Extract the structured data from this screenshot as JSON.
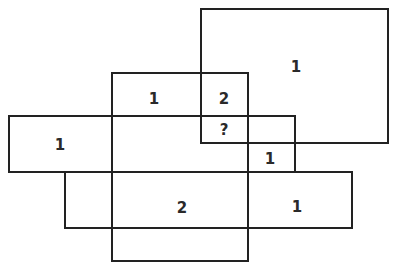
{
  "diagram": {
    "line_color": "#222222",
    "rectangles": [
      {
        "id": "big-square",
        "x": 200,
        "y": 8,
        "w": 189,
        "h": 136
      },
      {
        "id": "tall-center",
        "x": 111,
        "y": 72,
        "w": 138,
        "h": 190
      },
      {
        "id": "left-bar",
        "x": 8,
        "y": 115,
        "w": 288,
        "h": 58
      },
      {
        "id": "bottom-bar",
        "x": 64,
        "y": 171,
        "w": 289,
        "h": 58
      }
    ],
    "labels": [
      {
        "id": "big-square-only",
        "text": "1",
        "x": 296,
        "y": 67
      },
      {
        "id": "tall-top",
        "text": "1",
        "x": 154,
        "y": 99
      },
      {
        "id": "tall-big-overlap",
        "text": "2",
        "x": 224,
        "y": 99
      },
      {
        "id": "triple-overlap",
        "text": "?",
        "x": 224,
        "y": 130
      },
      {
        "id": "left-bar-only",
        "text": "1",
        "x": 60,
        "y": 145
      },
      {
        "id": "left-big-overlap",
        "text": "1",
        "x": 270,
        "y": 159
      },
      {
        "id": "tall-bottom-overlap",
        "text": "2",
        "x": 182,
        "y": 208
      },
      {
        "id": "bottom-bar-right",
        "text": "1",
        "x": 297,
        "y": 207
      }
    ]
  }
}
